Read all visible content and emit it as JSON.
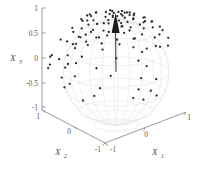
{
  "figure": {
    "type": "3d-scatter-sphere",
    "background": "#ffffff",
    "point_color": "#2b2b2b",
    "sphere_color": "#e2e2e4",
    "axis_color": "#8d8d90",
    "arrow_color": "#1c1c1c"
  },
  "chart_data": {
    "type": "scatter",
    "title": "",
    "xlabel": "X_1",
    "ylabel": "X_2",
    "zlabel": "X_3",
    "xlim": [
      -1,
      1
    ],
    "ylim": [
      -1,
      1
    ],
    "zlim": [
      -1,
      1
    ],
    "grid": false,
    "legend": null,
    "projection": "3d",
    "annotations": [
      {
        "kind": "arrow",
        "label": "mean direction",
        "from": [
          0,
          0,
          0
        ],
        "to": [
          0,
          0,
          1
        ]
      }
    ],
    "unit_sphere": true,
    "points_xyz": [
      [
        0.05,
        0.12,
        0.99
      ],
      [
        -0.1,
        0.06,
        0.99
      ],
      [
        0.14,
        -0.04,
        0.99
      ],
      [
        -0.02,
        -0.13,
        0.99
      ],
      [
        0.19,
        0.09,
        0.98
      ],
      [
        -0.21,
        0.04,
        0.98
      ],
      [
        0.07,
        0.21,
        0.97
      ],
      [
        -0.08,
        -0.2,
        0.98
      ],
      [
        0.26,
        -0.1,
        0.96
      ],
      [
        -0.27,
        0.12,
        0.95
      ],
      [
        0.31,
        0.14,
        0.94
      ],
      [
        -0.33,
        -0.08,
        0.94
      ],
      [
        0.12,
        0.34,
        0.93
      ],
      [
        -0.14,
        -0.32,
        0.94
      ],
      [
        0.38,
        0.02,
        0.92
      ],
      [
        -0.4,
        0.07,
        0.91
      ],
      [
        0.22,
        -0.36,
        0.91
      ],
      [
        -0.25,
        0.35,
        0.9
      ],
      [
        0.44,
        0.17,
        0.88
      ],
      [
        -0.46,
        -0.12,
        0.88
      ],
      [
        0.05,
        0.48,
        0.88
      ],
      [
        -0.09,
        -0.47,
        0.88
      ],
      [
        0.51,
        -0.05,
        0.86
      ],
      [
        -0.52,
        0.1,
        0.85
      ],
      [
        0.3,
        0.44,
        0.85
      ],
      [
        -0.33,
        -0.42,
        0.84
      ],
      [
        0.56,
        0.2,
        0.8
      ],
      [
        -0.58,
        0.15,
        0.8
      ],
      [
        0.16,
        0.59,
        0.79
      ],
      [
        -0.19,
        -0.57,
        0.8
      ],
      [
        0.62,
        -0.12,
        0.78
      ],
      [
        -0.63,
        -0.06,
        0.77
      ],
      [
        0.4,
        0.5,
        0.77
      ],
      [
        -0.43,
        0.48,
        0.77
      ],
      [
        0.67,
        0.09,
        0.74
      ],
      [
        -0.68,
        0.14,
        0.72
      ],
      [
        0.07,
        0.69,
        0.72
      ],
      [
        -0.11,
        -0.67,
        0.73
      ],
      [
        0.72,
        -0.18,
        0.67
      ],
      [
        -0.73,
        0.11,
        0.67
      ],
      [
        0.48,
        0.55,
        0.68
      ],
      [
        -0.5,
        -0.53,
        0.69
      ],
      [
        0.77,
        0.05,
        0.64
      ],
      [
        -0.78,
        -0.09,
        0.62
      ],
      [
        0.21,
        0.75,
        0.63
      ],
      [
        -0.24,
        -0.73,
        0.64
      ],
      [
        0.8,
        0.22,
        0.56
      ],
      [
        -0.82,
        0.17,
        0.54
      ],
      [
        0.58,
        0.58,
        0.57
      ],
      [
        -0.6,
        0.55,
        0.58
      ],
      [
        0.85,
        -0.1,
        0.52
      ],
      [
        -0.86,
        -0.05,
        0.51
      ],
      [
        0.12,
        0.84,
        0.53
      ],
      [
        -0.16,
        -0.82,
        0.55
      ],
      [
        0.88,
        0.14,
        0.45
      ],
      [
        -0.89,
        0.09,
        0.44
      ],
      [
        0.65,
        0.62,
        0.44
      ],
      [
        -0.67,
        -0.59,
        0.45
      ],
      [
        0.91,
        -0.16,
        0.38
      ],
      [
        -0.92,
        0.12,
        0.37
      ],
      [
        0.28,
        0.88,
        0.38
      ],
      [
        -0.31,
        -0.86,
        0.4
      ],
      [
        0.94,
        0.06,
        0.33
      ],
      [
        -0.94,
        -0.11,
        0.32
      ],
      [
        0.72,
        0.62,
        0.31
      ],
      [
        -0.74,
        0.59,
        0.32
      ],
      [
        0.04,
        0.95,
        0.3
      ],
      [
        -0.08,
        -0.94,
        0.33
      ],
      [
        0.96,
        0.18,
        0.21
      ],
      [
        -0.97,
        0.14,
        0.19
      ],
      [
        0.8,
        0.55,
        0.23
      ],
      [
        -0.82,
        -0.52,
        0.24
      ],
      [
        0.36,
        0.91,
        0.2
      ],
      [
        -0.39,
        -0.89,
        0.23
      ],
      [
        0.98,
        -0.08,
        0.17
      ],
      [
        -0.98,
        -0.04,
        0.16
      ],
      [
        0.6,
        0.78,
        0.17
      ],
      [
        -0.63,
        0.74,
        0.18
      ],
      [
        0.17,
        0.97,
        0.15
      ],
      [
        -0.21,
        -0.96,
        0.17
      ],
      [
        0.99,
        0.1,
        0.06
      ],
      [
        -0.99,
        0.06,
        0.05
      ],
      [
        0.86,
        0.5,
        0.08
      ],
      [
        -0.88,
        -0.46,
        0.09
      ],
      [
        0.45,
        0.89,
        0.07
      ],
      [
        -0.48,
        -0.87,
        0.09
      ],
      [
        0.07,
        0.99,
        0.04
      ],
      [
        -0.12,
        -0.99,
        0.06
      ],
      [
        0.7,
        0.71,
        0.02
      ],
      [
        -0.73,
        0.68,
        0.03
      ],
      [
        0.3,
        0.95,
        0.02
      ],
      [
        -0.34,
        -0.94,
        0.04
      ],
      [
        0.52,
        0.85,
        -0.05
      ],
      [
        -0.55,
        0.83,
        -0.04
      ],
      [
        0.94,
        0.33,
        -0.06
      ],
      [
        -0.95,
        -0.29,
        -0.05
      ],
      [
        0.02,
        0.09,
        0.99
      ],
      [
        -0.05,
        0.17,
        0.98
      ],
      [
        0.09,
        -0.15,
        0.98
      ],
      [
        0.16,
        0.03,
        0.99
      ],
      [
        -0.17,
        -0.02,
        0.99
      ],
      [
        0.24,
        0.2,
        0.95
      ],
      [
        -0.22,
        0.25,
        0.94
      ],
      [
        0.03,
        -0.28,
        0.96
      ],
      [
        0.35,
        -0.22,
        0.91
      ],
      [
        -0.36,
        -0.19,
        0.91
      ],
      [
        0.41,
        0.3,
        0.86
      ],
      [
        -0.44,
        0.27,
        0.86
      ],
      [
        0.1,
        -0.45,
        0.88
      ],
      [
        0.54,
        0.33,
        0.77
      ],
      [
        -0.56,
        -0.3,
        0.77
      ],
      [
        0.02,
        0.58,
        0.81
      ],
      [
        0.64,
        0.38,
        0.66
      ],
      [
        -0.66,
        0.35,
        0.66
      ],
      [
        0.18,
        -0.66,
        0.73
      ],
      [
        0.74,
        0.41,
        0.53
      ],
      [
        -0.76,
        -0.38,
        0.53
      ],
      [
        0.05,
        0.79,
        0.61
      ],
      [
        0.83,
        0.36,
        0.42
      ],
      [
        -0.85,
        0.32,
        0.41
      ]
    ],
    "n_points": 120
  },
  "axes": {
    "x3": {
      "name": "X",
      "sub": "3",
      "ticks": [
        "1",
        "0.5",
        "0",
        "-0.5",
        "-1"
      ]
    },
    "x2": {
      "name": "X",
      "sub": "2",
      "ticks": [
        "1",
        "0",
        "-1"
      ]
    },
    "x1": {
      "name": "X",
      "sub": "1",
      "ticks": [
        "-1",
        "0",
        "1"
      ]
    }
  }
}
